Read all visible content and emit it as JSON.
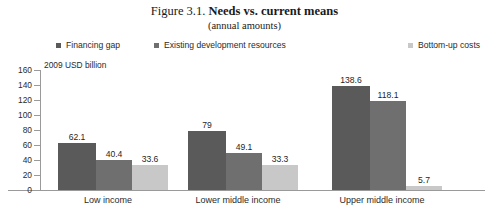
{
  "figure": {
    "title_prefix": "Figure 3.1. ",
    "title_main": "Needs vs. current means",
    "subtitle": "(annual amounts)"
  },
  "chart_data": {
    "type": "bar",
    "title": "Figure 3.1. Needs vs. current means",
    "subtitle": "(annual amounts)",
    "xlabel": "",
    "ylabel": "2009 USD billion",
    "ylim": [
      0,
      160
    ],
    "ytick_step": 20,
    "yticks": [
      0,
      20,
      40,
      60,
      80,
      100,
      120,
      140,
      160
    ],
    "grid": false,
    "legend_position": "top",
    "categories": [
      "Low income",
      "Lower middle income",
      "Upper middle income"
    ],
    "series": [
      {
        "name": "Financing gap",
        "color": "#5a5a5a",
        "values": [
          62.1,
          79,
          138.6
        ],
        "labels": [
          "62.1",
          "79",
          "138.6"
        ]
      },
      {
        "name": "Existing development resources",
        "color": "#6f6f6f",
        "values": [
          40.4,
          49.1,
          118.1
        ],
        "labels": [
          "40.4",
          "49.1",
          "118.1"
        ]
      },
      {
        "name": "Bottom-up costs",
        "color": "#c8c8c8",
        "values": [
          33.6,
          33.3,
          5.7
        ],
        "labels": [
          "33.6",
          "33.3",
          "5.7"
        ]
      }
    ]
  }
}
